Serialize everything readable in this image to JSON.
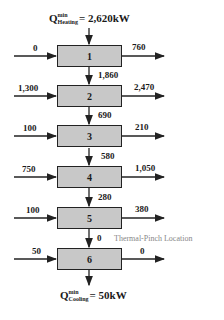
{
  "diagram": {
    "top_label": {
      "symbol": "Q",
      "sup": "min",
      "sub": "Heating",
      "value": "= 2,620kW"
    },
    "bottom_label": {
      "symbol": "Q",
      "sup": "min",
      "sub": "Cooling",
      "value": "= 50kW"
    },
    "pinch_label": "Thermal-Pinch Location",
    "intervals": [
      {
        "id": "1",
        "inflow": "0",
        "outflow": "760"
      },
      {
        "id": "2",
        "inflow": "1,300",
        "outflow": "2,470"
      },
      {
        "id": "3",
        "inflow": "100",
        "outflow": "210"
      },
      {
        "id": "4",
        "inflow": "750",
        "outflow": "1,050"
      },
      {
        "id": "5",
        "inflow": "100",
        "outflow": "380"
      },
      {
        "id": "6",
        "inflow": "50",
        "outflow": "0"
      }
    ],
    "cascade": [
      "1,860",
      "690",
      "580",
      "280",
      "0"
    ],
    "colors": {
      "box_fill": "#c8c8c8",
      "stroke": "#222222",
      "pinch_text": "#888888"
    }
  }
}
